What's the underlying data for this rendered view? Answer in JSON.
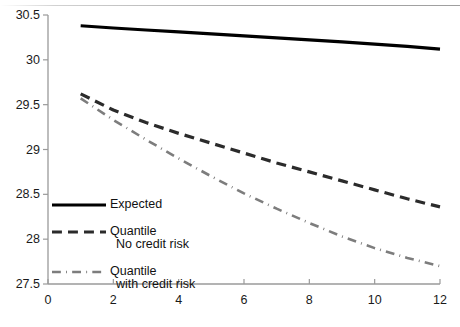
{
  "chart_data": {
    "type": "line",
    "title": "",
    "xlabel": "",
    "ylabel": "",
    "xlim": [
      0,
      12
    ],
    "ylim": [
      27.5,
      30.5
    ],
    "xticks": [
      0,
      2,
      4,
      6,
      8,
      10,
      12
    ],
    "xtick_labels": [
      "0",
      "2",
      "4",
      "6",
      "8",
      "10",
      "12"
    ],
    "yticks": [
      27.5,
      28,
      28.5,
      29,
      29.5,
      30,
      30.5
    ],
    "ytick_labels": [
      "27.5",
      "28",
      "28.5",
      "29",
      "29.5",
      "30",
      "30.5"
    ],
    "grid": false,
    "legend_position": "lower-left-inside",
    "x": [
      1,
      2,
      3,
      4,
      5,
      6,
      7,
      8,
      9,
      10,
      11,
      12
    ],
    "series": [
      {
        "name": "Expected",
        "legend_label": "Expected",
        "style": "solid",
        "color": "#000000",
        "width": 3.2,
        "values": [
          30.38,
          30.355,
          30.333,
          30.311,
          30.289,
          30.267,
          30.245,
          30.223,
          30.2,
          30.176,
          30.15,
          30.12
        ]
      },
      {
        "name": "Quantile No credit risk",
        "legend_label": "Quantile",
        "legend_label_line2": "No credit risk",
        "style": "dashed",
        "color": "#2b2b2b",
        "width": 3.2,
        "values": [
          29.62,
          29.44,
          29.3,
          29.18,
          29.07,
          28.96,
          28.85,
          28.75,
          28.65,
          28.55,
          28.45,
          28.36
        ]
      },
      {
        "name": "Quantile with credit risk",
        "legend_label": "Quantile",
        "legend_label_line2": "with credit risk",
        "style": "dashdot",
        "color": "#7d7d7d",
        "width": 2.6,
        "values": [
          29.57,
          29.33,
          29.11,
          28.9,
          28.7,
          28.51,
          28.34,
          28.18,
          28.03,
          27.9,
          27.79,
          27.7
        ]
      }
    ]
  },
  "axes": {
    "spine_color": "#9a9a9a",
    "tick_color": "#9a9a9a",
    "background": "#ffffff"
  },
  "legend": {
    "entries": [
      {
        "label": "Expected",
        "label2": ""
      },
      {
        "label": "Quantile",
        "label2": "No credit risk"
      },
      {
        "label": "Quantile",
        "label2": "with credit risk"
      }
    ]
  }
}
